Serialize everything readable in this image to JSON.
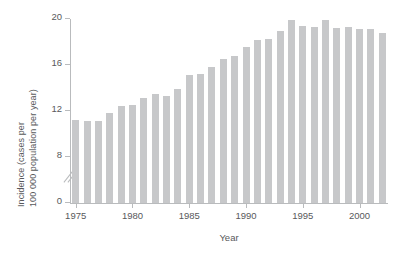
{
  "chart_data": {
    "type": "bar",
    "title": "",
    "xlabel": "Year",
    "ylabel": "Incidence (cases per 100 000 population per year)",
    "ylabel_line1": "Incidence (cases per",
    "ylabel_line2": "100 000 population per year)",
    "ylim": [
      0,
      20
    ],
    "yticks": [
      0,
      8,
      12,
      16,
      20
    ],
    "ytick_labels": [
      "0",
      "8",
      "12",
      "16",
      "20"
    ],
    "y_axis_break": true,
    "y_axis_break_between": [
      0,
      8
    ],
    "xlim": [
      1974.5,
      2002.5
    ],
    "xticks": [
      1975,
      1980,
      1985,
      1990,
      1995,
      2000
    ],
    "xtick_labels": [
      "1975",
      "1980",
      "1985",
      "1990",
      "1995",
      "2000"
    ],
    "grid": false,
    "legend": null,
    "bar_color": "#c7c8ca",
    "axis_color": "#b9bbbd",
    "text_color": "#58595b",
    "categories": [
      1975,
      1976,
      1977,
      1978,
      1979,
      1980,
      1981,
      1982,
      1983,
      1984,
      1985,
      1986,
      1987,
      1988,
      1989,
      1990,
      1991,
      1992,
      1993,
      1994,
      1995,
      1996,
      1997,
      1998,
      1999,
      2000,
      2001,
      2002
    ],
    "values": [
      11.2,
      11.1,
      11.1,
      11.8,
      12.4,
      12.5,
      13.1,
      13.5,
      13.3,
      13.9,
      15.1,
      15.2,
      15.8,
      16.5,
      16.8,
      17.6,
      18.2,
      18.3,
      19.0,
      19.9,
      19.4,
      19.3,
      19.9,
      19.2,
      19.3,
      19.1,
      19.1,
      18.8
    ]
  }
}
